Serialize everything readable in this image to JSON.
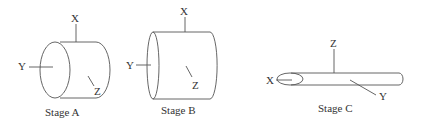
{
  "figure": {
    "stages": [
      {
        "caption": "Stage A",
        "shape": "short cylinder, circular face toward viewer-left",
        "axes": {
          "x": "X",
          "y": "Y",
          "z": "Z"
        }
      },
      {
        "caption": "Stage B",
        "shape": "longer cylinder, face toward left",
        "axes": {
          "x": "X",
          "y": "Y",
          "z": "Z"
        }
      },
      {
        "caption": "Stage C",
        "shape": "elongated thin rod",
        "axes": {
          "x": "X",
          "y": "Y",
          "z": "Z"
        }
      }
    ]
  }
}
